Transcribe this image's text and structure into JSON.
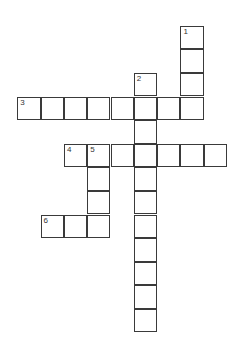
{
  "puzzle": {
    "type": "crossword",
    "cell_size": 23.3,
    "origin": {
      "x": 17.3,
      "y": 25.7
    },
    "row_height": 23.6,
    "line_color": "#3a3a3a",
    "cells": [
      {
        "r": 0,
        "c": 7,
        "num": "1"
      },
      {
        "r": 1,
        "c": 7
      },
      {
        "r": 2,
        "c": 7
      },
      {
        "r": 2,
        "c": 5,
        "num": "2"
      },
      {
        "r": 3,
        "c": 0,
        "num": "3"
      },
      {
        "r": 3,
        "c": 1
      },
      {
        "r": 3,
        "c": 2
      },
      {
        "r": 3,
        "c": 3
      },
      {
        "r": 3,
        "c": 4
      },
      {
        "r": 3,
        "c": 5
      },
      {
        "r": 3,
        "c": 6
      },
      {
        "r": 3,
        "c": 7
      },
      {
        "r": 4,
        "c": 5
      },
      {
        "r": 5,
        "c": 2,
        "num": "4"
      },
      {
        "r": 5,
        "c": 3,
        "num": "5"
      },
      {
        "r": 5,
        "c": 4
      },
      {
        "r": 5,
        "c": 5
      },
      {
        "r": 5,
        "c": 6
      },
      {
        "r": 5,
        "c": 7
      },
      {
        "r": 5,
        "c": 8
      },
      {
        "r": 6,
        "c": 3
      },
      {
        "r": 6,
        "c": 5
      },
      {
        "r": 7,
        "c": 3
      },
      {
        "r": 7,
        "c": 5
      },
      {
        "r": 8,
        "c": 1,
        "num": "6"
      },
      {
        "r": 8,
        "c": 2
      },
      {
        "r": 8,
        "c": 3
      },
      {
        "r": 8,
        "c": 5
      },
      {
        "r": 9,
        "c": 5
      },
      {
        "r": 10,
        "c": 5
      },
      {
        "r": 11,
        "c": 5
      },
      {
        "r": 12,
        "c": 5
      }
    ],
    "words": [
      {
        "num": "1",
        "direction": "down",
        "length": 4
      },
      {
        "num": "2",
        "direction": "down",
        "length": 11
      },
      {
        "num": "3",
        "direction": "across",
        "length": 8
      },
      {
        "num": "4",
        "direction": "across",
        "length": 7
      },
      {
        "num": "5",
        "direction": "down",
        "length": 4
      },
      {
        "num": "6",
        "direction": "across",
        "length": 3
      }
    ]
  }
}
